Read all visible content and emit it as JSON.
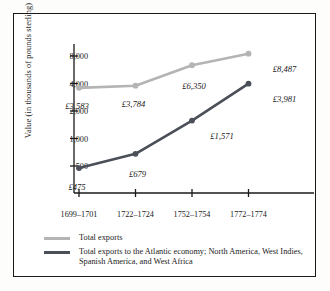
{
  "chart_data": {
    "type": "line",
    "title": "",
    "xlabel": "",
    "ylabel": "Value (in thousands of pounds sterling)",
    "categories": [
      "1699–1701",
      "1722–1724",
      "1752–1754",
      "1772–1774"
    ],
    "yscale": "log",
    "ylim": [
      350,
      11000
    ],
    "yticks": [
      500,
      1000,
      2000,
      4000,
      8000
    ],
    "ytick_labels": [
      "500",
      "1,000",
      "2,000",
      "4,000",
      "8,000"
    ],
    "grid": false,
    "legend_position": "below-plot",
    "series": [
      {
        "name": "Total exports",
        "color": "#b4b4b4",
        "values": [
          3583,
          3784,
          6350,
          8487
        ],
        "point_labels": [
          "£3,583",
          "£3,784",
          "£6,350",
          "£8,487"
        ]
      },
      {
        "name": "Total exports to the Atlantic economy; North America, West Indies, Spanish America, and West Africa",
        "color": "#4a4f58",
        "values": [
          475,
          679,
          1571,
          3981
        ],
        "point_labels": [
          "£475",
          "£679",
          "£1,571",
          "£3,981"
        ]
      }
    ]
  },
  "legend": {
    "items": [
      {
        "label": "Total exports",
        "color": "#b4b4b4"
      },
      {
        "label": "Total exports to the Atlantic economy; North America, West Indies, Spanish America, and West Africa",
        "color": "#4a4f58"
      }
    ]
  },
  "colors": {
    "total_exports": "#b4b4b4",
    "atlantic_exports": "#4a4f58",
    "axis": "#1a1a1a",
    "frame": "#1a1a1a",
    "background": "#ffffff"
  }
}
